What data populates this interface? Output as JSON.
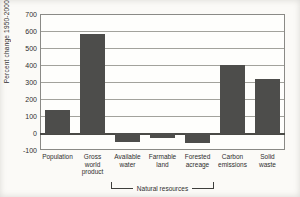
{
  "chart_data": {
    "type": "bar",
    "title": "",
    "xlabel": "",
    "ylabel": "Percent change 1950-2000",
    "ylim": [
      -100,
      700
    ],
    "yticks": [
      700,
      600,
      500,
      400,
      300,
      200,
      100,
      0,
      -100
    ],
    "grid": true,
    "legend": "none",
    "bar_color": "#4d4d4b",
    "categories": [
      "Population",
      "Gross world product",
      "Available water",
      "Farmable land",
      "Forested acreage",
      "Carbon emissions",
      "Solid waste"
    ],
    "category_label_lines": [
      [
        "Population"
      ],
      [
        "Gross",
        "world",
        "product"
      ],
      [
        "Available",
        "water"
      ],
      [
        "Farmable",
        "land"
      ],
      [
        "Forested",
        "acreage"
      ],
      [
        "Carbon",
        "emissions"
      ],
      [
        "Solid",
        "waste"
      ]
    ],
    "values": [
      135,
      585,
      -45,
      -25,
      -50,
      400,
      315
    ],
    "group_bracket": {
      "label": "Natural resources",
      "start_index": 2,
      "end_index": 4
    }
  }
}
